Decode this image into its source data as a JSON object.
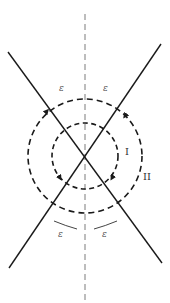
{
  "diagram": {
    "type": "crossing-lines-with-contours",
    "colors": {
      "line": "#1a1a1a",
      "axis": "#999999",
      "contour": "#1a1a1a",
      "label": "#555555"
    },
    "labels": {
      "eps_top_left": "ε",
      "eps_top_right": "ε",
      "eps_bottom_left": "ε",
      "eps_bottom_right": "ε",
      "contour_inner": "I",
      "contour_outer": "II"
    },
    "contours": [
      {
        "name": "I",
        "radius": 33,
        "direction": "clockwise"
      },
      {
        "name": "II",
        "radius": 57,
        "direction": "clockwise"
      }
    ]
  }
}
